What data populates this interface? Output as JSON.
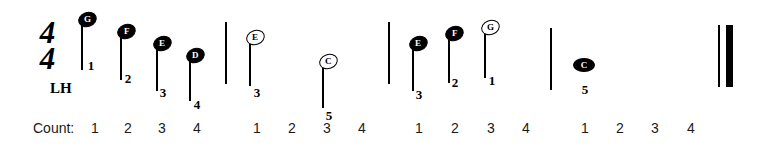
{
  "exercise": {
    "time_signature": {
      "numerator": "4",
      "denominator": "4"
    },
    "hand_label": "LH",
    "count_label": "Count:"
  },
  "barlines": [
    {
      "name": "barline-1",
      "x": 225,
      "y": 22,
      "height": 62
    },
    {
      "name": "barline-2",
      "x": 388,
      "y": 22,
      "height": 62
    },
    {
      "name": "barline-3",
      "x": 550,
      "y": 28,
      "height": 62
    }
  ],
  "end_barline": {
    "thin_x": 718,
    "thick_x": 726,
    "y": 25,
    "height": 62
  },
  "notes": [
    {
      "pitch": "G",
      "finger": "1",
      "head": "filled",
      "stem": true,
      "x": 78,
      "head_y": 12,
      "stem_len": 50,
      "finger_x": 84,
      "finger_y": 58
    },
    {
      "pitch": "F",
      "finger": "2",
      "head": "filled",
      "stem": true,
      "x": 117,
      "head_y": 24,
      "stem_len": 48,
      "finger_x": 121,
      "finger_y": 71
    },
    {
      "pitch": "E",
      "finger": "3",
      "head": "filled",
      "stem": true,
      "x": 153,
      "head_y": 36,
      "stem_len": 47,
      "finger_x": 156,
      "finger_y": 85
    },
    {
      "pitch": "D",
      "finger": "4",
      "head": "filled",
      "stem": true,
      "x": 186,
      "head_y": 48,
      "stem_len": 45,
      "finger_x": 190,
      "finger_y": 97
    },
    {
      "pitch": "E",
      "finger": "3",
      "head": "hollow",
      "stem": true,
      "x": 246,
      "head_y": 30,
      "stem_len": 48,
      "finger_x": 250,
      "finger_y": 85
    },
    {
      "pitch": "C",
      "finger": "5",
      "head": "hollow",
      "stem": true,
      "x": 319,
      "head_y": 54,
      "stem_len": 46,
      "finger_x": 322,
      "finger_y": 108
    },
    {
      "pitch": "E",
      "finger": "3",
      "head": "filled",
      "stem": true,
      "x": 409,
      "head_y": 36,
      "stem_len": 47,
      "finger_x": 412,
      "finger_y": 87
    },
    {
      "pitch": "F",
      "finger": "2",
      "head": "filled",
      "stem": true,
      "x": 445,
      "head_y": 26,
      "stem_len": 49,
      "finger_x": 448,
      "finger_y": 75
    },
    {
      "pitch": "G",
      "finger": "1",
      "head": "hollow",
      "stem": true,
      "x": 481,
      "head_y": 20,
      "stem_len": 50,
      "finger_x": 485,
      "finger_y": 73
    },
    {
      "pitch": "C",
      "finger": "5",
      "head": "whole",
      "stem": false,
      "x": 573,
      "head_y": 58,
      "stem_len": 0,
      "finger_x": 578,
      "finger_y": 82
    }
  ],
  "counts": [
    {
      "beat": "1",
      "x": 88
    },
    {
      "beat": "2",
      "x": 121
    },
    {
      "beat": "3",
      "x": 155
    },
    {
      "beat": "4",
      "x": 190
    },
    {
      "beat": "1",
      "x": 250
    },
    {
      "beat": "2",
      "x": 285
    },
    {
      "beat": "3",
      "x": 320
    },
    {
      "beat": "4",
      "x": 355
    },
    {
      "beat": "1",
      "x": 412
    },
    {
      "beat": "2",
      "x": 448
    },
    {
      "beat": "3",
      "x": 484
    },
    {
      "beat": "4",
      "x": 519
    },
    {
      "beat": "1",
      "x": 578
    },
    {
      "beat": "2",
      "x": 613
    },
    {
      "beat": "3",
      "x": 648
    },
    {
      "beat": "4",
      "x": 684
    }
  ]
}
